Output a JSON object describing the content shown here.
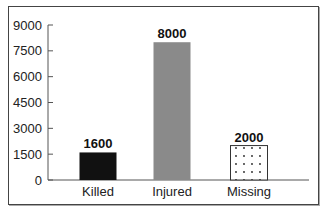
{
  "chart_data": {
    "type": "bar",
    "title": "",
    "xlabel": "",
    "ylabel": "",
    "categories": [
      "Killed",
      "Injured",
      "Missing"
    ],
    "values": [
      1600,
      8000,
      2000
    ],
    "value_labels": [
      "1600",
      "8000",
      "2000"
    ],
    "ylim": [
      0,
      9000
    ],
    "yticks": [
      0,
      1500,
      3000,
      4500,
      6000,
      7500,
      9000
    ],
    "ytick_labels": [
      "0",
      "1500",
      "3000",
      "4500",
      "6000",
      "7500",
      "9000"
    ],
    "bar_styles": [
      {
        "fill": "#111111",
        "pattern": "solid"
      },
      {
        "fill": "#8a8a8a",
        "pattern": "solid"
      },
      {
        "fill": "#ffffff",
        "pattern": "dots"
      }
    ],
    "grid": false,
    "legend": null
  }
}
